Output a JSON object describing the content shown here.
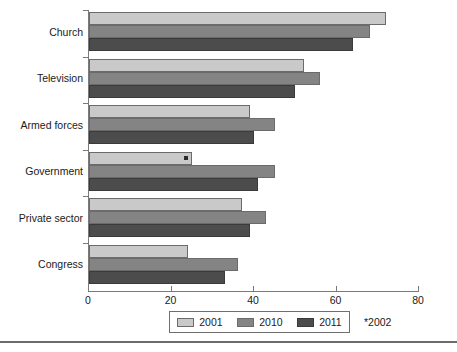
{
  "chart_data": {
    "type": "bar",
    "orientation": "horizontal",
    "title": "",
    "subtitle": "",
    "xlabel": "",
    "ylabel": "",
    "xlim": [
      0,
      80
    ],
    "xticks": [
      0,
      20,
      40,
      60,
      80
    ],
    "xtick_labels": [
      "0",
      "20",
      "40",
      "60",
      "80"
    ],
    "grid": false,
    "legend_position": "bottom-center",
    "categories": [
      "Church",
      "Television",
      "Armed forces",
      "Government",
      "Private sector",
      "Congress"
    ],
    "series": [
      {
        "name": "2001",
        "color": "#c9c9c9",
        "values": [
          72,
          52,
          39,
          25,
          37,
          24
        ]
      },
      {
        "name": "2010",
        "color": "#848484",
        "values": [
          68,
          56,
          45,
          45,
          43,
          36
        ]
      },
      {
        "name": "2011",
        "color": "#4c4c4c",
        "values": [
          64,
          50,
          40,
          41,
          39,
          33
        ]
      }
    ],
    "annotations": [
      {
        "text": "*2002",
        "note": "asterisk marker on Government 2001 bar"
      }
    ]
  },
  "axes": {
    "x_ticks": [
      {
        "label": "0",
        "value": 0
      },
      {
        "label": "20",
        "value": 20
      },
      {
        "label": "40",
        "value": 40
      },
      {
        "label": "60",
        "value": 60
      },
      {
        "label": "80",
        "value": 80
      }
    ],
    "categories": [
      {
        "label": "Church"
      },
      {
        "label": "Television"
      },
      {
        "label": "Armed forces"
      },
      {
        "label": "Government"
      },
      {
        "label": "Private sector"
      },
      {
        "label": "Congress"
      }
    ]
  },
  "legend": {
    "entries": [
      {
        "label": "2001",
        "color": "#c9c9c9"
      },
      {
        "label": "2010",
        "color": "#848484"
      },
      {
        "label": "2011",
        "color": "#4c4c4c"
      }
    ]
  },
  "footnote": {
    "text": "*2002"
  }
}
